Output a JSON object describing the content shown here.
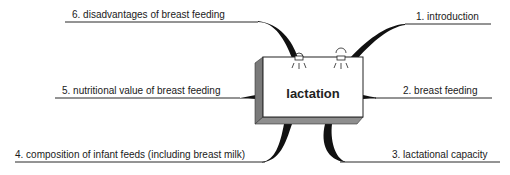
{
  "diagram": {
    "type": "mind-map",
    "central_topic": "lactation",
    "colors": {
      "line": "#111111",
      "box_face": "#ffffff",
      "box_side": "#7a7a7a",
      "box_bottom": "#8e8e8e",
      "text": "#1a1a1a"
    },
    "branches": [
      {
        "id": 1,
        "label": "1. introduction",
        "side": "right",
        "position": "top"
      },
      {
        "id": 2,
        "label": "2. breast feeding",
        "side": "right",
        "position": "middle"
      },
      {
        "id": 3,
        "label": "3. lactational capacity",
        "side": "right",
        "position": "bottom"
      },
      {
        "id": 4,
        "label": "4. composition of infant feeds (including breast milk)",
        "side": "left",
        "position": "bottom"
      },
      {
        "id": 5,
        "label": "5. nutritional value of breast feeding",
        "side": "left",
        "position": "middle"
      },
      {
        "id": 6,
        "label": "6. disadvantages of breast feeding",
        "side": "left",
        "position": "top"
      }
    ],
    "decorations": [
      "spotlight-icon",
      "spotlight-icon"
    ]
  }
}
